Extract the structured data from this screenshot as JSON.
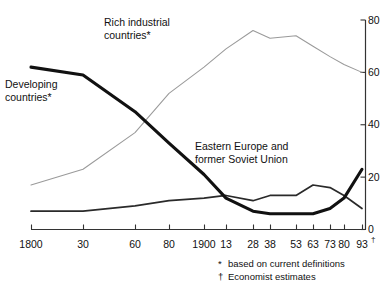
{
  "chart_data": {
    "type": "line",
    "title": "",
    "subtitle": "",
    "xlabel": "",
    "ylabel": "",
    "ylim": [
      0,
      80
    ],
    "yticks": [
      0,
      20,
      40,
      60,
      80
    ],
    "ytick_labels": [
      "0",
      "20",
      "40",
      "60",
      "80"
    ],
    "y_axis_position": "right",
    "grid": false,
    "legend_position": "inline-annotations",
    "x": [
      "1800",
      "30",
      "60",
      "80",
      "1900",
      "13",
      "28",
      "38",
      "53",
      "63",
      "73",
      "80",
      "93"
    ],
    "xtick_labels": [
      "1800",
      "30",
      "60",
      "80",
      "1900",
      "13",
      "28",
      "38",
      "53",
      "63",
      "73",
      "80",
      "93"
    ],
    "xtick_last_suffix": "†",
    "series": [
      {
        "name": "Developing countries*",
        "style": "thick-black",
        "color": "#111111",
        "values": [
          62,
          59,
          45,
          33,
          21,
          12,
          7,
          6,
          6,
          6,
          8,
          12,
          23
        ]
      },
      {
        "name": "Rich industrial countries*",
        "style": "thin-grey",
        "color": "#9a9a9a",
        "values": [
          17,
          23,
          37,
          52,
          62,
          69,
          76,
          73,
          74,
          70,
          66,
          63,
          60
        ]
      },
      {
        "name": "Eastern Europe and former Soviet Union",
        "style": "medium-black",
        "color": "#2a2a2a",
        "values": [
          7,
          7,
          9,
          11,
          12,
          13,
          11,
          13,
          13,
          17,
          16,
          13,
          8
        ]
      }
    ],
    "annotations": [
      {
        "name": "Rich industrial countries*",
        "lines": [
          "Rich industrial",
          "countries*"
        ]
      },
      {
        "name": "Developing countries*",
        "lines": [
          "Developing",
          "countries*"
        ]
      },
      {
        "name": "Eastern Europe and former Soviet Union",
        "lines": [
          "Eastern Europe and",
          "former Soviet Union"
        ]
      }
    ],
    "footnotes": [
      {
        "mark": "*",
        "text": "based on current definitions"
      },
      {
        "mark": "†",
        "text": "Economist estimates"
      }
    ]
  },
  "axis": {
    "y": {
      "t80": "80",
      "t60": "60",
      "t40": "40",
      "t20": "20",
      "t0": "0"
    },
    "x": {
      "t1800": "1800",
      "t30": "30",
      "t60": "60",
      "t80": "80",
      "t1900": "1900",
      "t13": "13",
      "t28": "28",
      "t38": "38",
      "t53": "53",
      "t63": "63",
      "t73": "73",
      "t80b": "80",
      "t93": "93",
      "dagger": "†"
    }
  },
  "labels": {
    "rich": {
      "l1": "Rich industrial",
      "l2": "countries*"
    },
    "developing": {
      "l1": "Developing",
      "l2": "countries*"
    },
    "eastern": {
      "l1": "Eastern Europe and",
      "l2": "former Soviet Union"
    }
  },
  "footnotes": {
    "f1_mark": "*",
    "f1_text": "based on current definitions",
    "f2_mark": "†",
    "f2_text": "Economist estimates"
  }
}
